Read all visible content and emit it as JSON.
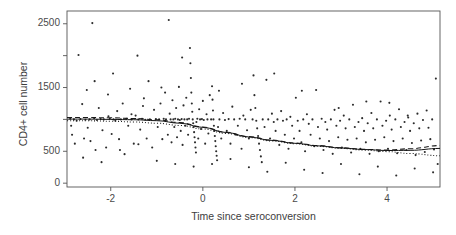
{
  "chart_data": {
    "type": "scatter",
    "title": "",
    "xlabel": "Time since seroconversion",
    "ylabel": "CD4+ cell number",
    "xlim": [
      -2.95,
      5.15
    ],
    "ylim": [
      -60,
      2700
    ],
    "grid": false,
    "legend": "none",
    "xticks": [
      -2,
      0,
      2,
      4
    ],
    "xticklabels": [
      "-2",
      "0",
      "2",
      "4"
    ],
    "yticks": [
      0,
      500,
      1000,
      1500,
      2000,
      2500
    ],
    "yticklabels": [
      "0",
      "500",
      "",
      "1500",
      "",
      "2500"
    ],
    "ytick_minor_unlabeled": [
      1000,
      2000
    ],
    "marker": "small-dot",
    "marker_color": "#2b2b2b",
    "marker_size_px": 1.4,
    "points": [
      [
        -2.88,
        1010
      ],
      [
        -2.86,
        900
      ],
      [
        -2.84,
        760
      ],
      [
        -2.8,
        1000
      ],
      [
        -2.78,
        620
      ],
      [
        -2.74,
        980
      ],
      [
        -2.7,
        2010
      ],
      [
        -2.66,
        1005
      ],
      [
        -2.62,
        1240
      ],
      [
        -2.58,
        700
      ],
      [
        -2.55,
        995
      ],
      [
        -2.52,
        1460
      ],
      [
        -2.5,
        870
      ],
      [
        -2.46,
        1000
      ],
      [
        -2.44,
        660
      ],
      [
        -2.4,
        2510
      ],
      [
        -2.36,
        1020
      ],
      [
        -2.33,
        520
      ],
      [
        -2.3,
        990
      ],
      [
        -2.26,
        1180
      ],
      [
        -2.22,
        1005
      ],
      [
        -2.18,
        830
      ],
      [
        -2.15,
        1000
      ],
      [
        -2.1,
        560
      ],
      [
        -2.06,
        1390
      ],
      [
        -2.02,
        1010
      ],
      [
        -1.98,
        770
      ],
      [
        -1.94,
        1000
      ],
      [
        -1.9,
        980
      ],
      [
        -1.86,
        1130
      ],
      [
        -1.82,
        690
      ],
      [
        -1.78,
        1000
      ],
      [
        -1.74,
        1250
      ],
      [
        -1.7,
        455
      ],
      [
        -1.66,
        1010
      ],
      [
        -1.62,
        900
      ],
      [
        -1.58,
        1480
      ],
      [
        -1.55,
        1000
      ],
      [
        -1.5,
        620
      ],
      [
        -1.46,
        1060
      ],
      [
        -1.42,
        2000
      ],
      [
        -1.4,
        1000
      ],
      [
        -1.36,
        840
      ],
      [
        -1.32,
        1010
      ],
      [
        -1.28,
        1330
      ],
      [
        -1.25,
        995
      ],
      [
        -1.22,
        700
      ],
      [
        -1.18,
        1600
      ],
      [
        -1.15,
        1000
      ],
      [
        -1.1,
        560
      ],
      [
        -1.06,
        1150
      ],
      [
        -1.02,
        1005
      ],
      [
        -0.98,
        880
      ],
      [
        -0.95,
        1000
      ],
      [
        -0.92,
        1250
      ],
      [
        -0.88,
        690
      ],
      [
        -0.85,
        1010
      ],
      [
        -0.82,
        1420
      ],
      [
        -0.8,
        1000
      ],
      [
        -0.76,
        760
      ],
      [
        -0.74,
        2560
      ],
      [
        -0.72,
        1090
      ],
      [
        -0.7,
        1000
      ],
      [
        -0.68,
        640
      ],
      [
        -0.66,
        1300
      ],
      [
        -0.64,
        1000
      ],
      [
        -0.62,
        880
      ],
      [
        -0.6,
        1010
      ],
      [
        -0.58,
        1180
      ],
      [
        -0.56,
        720
      ],
      [
        -0.54,
        1000
      ],
      [
        -0.52,
        1510
      ],
      [
        -0.5,
        990
      ],
      [
        -0.48,
        820
      ],
      [
        -0.46,
        1005
      ],
      [
        -0.44,
        600
      ],
      [
        -0.42,
        1220
      ],
      [
        -0.4,
        1000
      ],
      [
        -0.38,
        900
      ],
      [
        -0.36,
        1340
      ],
      [
        -0.34,
        1000
      ],
      [
        -0.32,
        760
      ],
      [
        -0.3,
        1010
      ],
      [
        -0.28,
        2120
      ],
      [
        -0.27,
        1880
      ],
      [
        -0.26,
        1650
      ],
      [
        -0.25,
        1420
      ],
      [
        -0.24,
        1250
      ],
      [
        -0.23,
        1120
      ],
      [
        -0.22,
        1000
      ],
      [
        -0.21,
        940
      ],
      [
        -0.2,
        880
      ],
      [
        -0.19,
        800
      ],
      [
        -0.18,
        720
      ],
      [
        -0.17,
        640
      ],
      [
        -0.16,
        560
      ],
      [
        -0.15,
        480
      ],
      [
        -0.14,
        960
      ],
      [
        -0.12,
        1010
      ],
      [
        -0.1,
        700
      ],
      [
        -0.08,
        1160
      ],
      [
        -0.06,
        1000
      ],
      [
        -0.04,
        850
      ],
      [
        -0.02,
        1005
      ],
      [
        0.0,
        1290
      ],
      [
        0.02,
        990
      ],
      [
        0.05,
        620
      ],
      [
        0.08,
        1080
      ],
      [
        0.1,
        1000
      ],
      [
        0.12,
        780
      ],
      [
        0.15,
        1380
      ],
      [
        0.18,
        1000
      ],
      [
        0.2,
        1520
      ],
      [
        0.21,
        1310
      ],
      [
        0.22,
        1140
      ],
      [
        0.23,
        1000
      ],
      [
        0.24,
        900
      ],
      [
        0.25,
        820
      ],
      [
        0.26,
        740
      ],
      [
        0.27,
        660
      ],
      [
        0.28,
        580
      ],
      [
        0.29,
        500
      ],
      [
        0.3,
        430
      ],
      [
        0.31,
        360
      ],
      [
        0.33,
        880
      ],
      [
        0.36,
        1000
      ],
      [
        0.4,
        700
      ],
      [
        0.44,
        1100
      ],
      [
        0.48,
        990
      ],
      [
        0.52,
        820
      ],
      [
        0.56,
        1005
      ],
      [
        0.6,
        620
      ],
      [
        0.64,
        1200
      ],
      [
        0.68,
        1000
      ],
      [
        0.72,
        760
      ],
      [
        0.76,
        900
      ],
      [
        0.8,
        1010
      ],
      [
        0.84,
        540
      ],
      [
        0.88,
        1060
      ],
      [
        0.92,
        1000
      ],
      [
        0.96,
        830
      ],
      [
        1.0,
        700
      ],
      [
        1.04,
        1150
      ],
      [
        1.08,
        1000
      ],
      [
        1.1,
        1690
      ],
      [
        1.12,
        1380
      ],
      [
        1.14,
        1180
      ],
      [
        1.16,
        980
      ],
      [
        1.18,
        860
      ],
      [
        1.2,
        740
      ],
      [
        1.22,
        620
      ],
      [
        1.24,
        520
      ],
      [
        1.26,
        420
      ],
      [
        1.28,
        330
      ],
      [
        1.3,
        1000
      ],
      [
        1.34,
        880
      ],
      [
        1.38,
        1620
      ],
      [
        1.42,
        1000
      ],
      [
        1.46,
        700
      ],
      [
        1.5,
        1090
      ],
      [
        1.54,
        960
      ],
      [
        1.58,
        820
      ],
      [
        1.62,
        1000
      ],
      [
        1.66,
        600
      ],
      [
        1.7,
        1130
      ],
      [
        1.74,
        980
      ],
      [
        1.78,
        760
      ],
      [
        1.82,
        1000
      ],
      [
        1.86,
        540
      ],
      [
        1.9,
        1040
      ],
      [
        1.94,
        900
      ],
      [
        1.98,
        700
      ],
      [
        2.02,
        1340
      ],
      [
        2.06,
        980
      ],
      [
        2.1,
        820
      ],
      [
        2.14,
        640
      ],
      [
        2.18,
        1000
      ],
      [
        2.22,
        500
      ],
      [
        2.26,
        1080
      ],
      [
        2.3,
        930
      ],
      [
        2.34,
        760
      ],
      [
        2.38,
        1000
      ],
      [
        2.42,
        580
      ],
      [
        2.46,
        1460
      ],
      [
        2.5,
        880
      ],
      [
        2.54,
        700
      ],
      [
        2.58,
        1010
      ],
      [
        2.62,
        520
      ],
      [
        2.66,
        960
      ],
      [
        2.7,
        840
      ],
      [
        2.74,
        660
      ],
      [
        2.78,
        1000
      ],
      [
        2.82,
        460
      ],
      [
        2.86,
        1150
      ],
      [
        2.9,
        900
      ],
      [
        2.94,
        720
      ],
      [
        2.98,
        980
      ],
      [
        3.02,
        560
      ],
      [
        3.06,
        1060
      ],
      [
        3.1,
        860
      ],
      [
        3.14,
        680
      ],
      [
        3.18,
        1000
      ],
      [
        3.22,
        480
      ],
      [
        3.26,
        1230
      ],
      [
        3.3,
        880
      ],
      [
        3.34,
        700
      ],
      [
        3.38,
        960
      ],
      [
        3.42,
        540
      ],
      [
        3.46,
        1020
      ],
      [
        3.5,
        820
      ],
      [
        3.54,
        640
      ],
      [
        3.58,
        940
      ],
      [
        3.62,
        460
      ],
      [
        3.66,
        1100
      ],
      [
        3.7,
        860
      ],
      [
        3.74,
        680
      ],
      [
        3.78,
        1000
      ],
      [
        3.82,
        500
      ],
      [
        3.86,
        1280
      ],
      [
        3.9,
        900
      ],
      [
        3.94,
        720
      ],
      [
        3.98,
        980
      ],
      [
        4.02,
        540
      ],
      [
        4.06,
        1060
      ],
      [
        4.1,
        840
      ],
      [
        4.14,
        660
      ],
      [
        4.18,
        1000
      ],
      [
        4.22,
        470
      ],
      [
        4.26,
        1160
      ],
      [
        4.3,
        880
      ],
      [
        4.34,
        700
      ],
      [
        4.38,
        960
      ],
      [
        4.42,
        520
      ],
      [
        4.46,
        1030
      ],
      [
        4.5,
        820
      ],
      [
        4.54,
        630
      ],
      [
        4.58,
        940
      ],
      [
        4.62,
        440
      ],
      [
        4.66,
        1090
      ],
      [
        4.7,
        860
      ],
      [
        4.74,
        670
      ],
      [
        4.78,
        990
      ],
      [
        4.82,
        490
      ],
      [
        4.86,
        1140
      ],
      [
        4.9,
        870
      ],
      [
        4.94,
        690
      ],
      [
        4.98,
        1000
      ],
      [
        5.02,
        530
      ],
      [
        5.06,
        1640
      ],
      [
        5.1,
        300
      ],
      [
        -2.6,
        400
      ],
      [
        -2.2,
        330
      ],
      [
        -1.8,
        520
      ],
      [
        -1.4,
        610
      ],
      [
        -1.0,
        350
      ],
      [
        -0.6,
        300
      ],
      [
        -0.2,
        260
      ],
      [
        0.2,
        300
      ],
      [
        0.6,
        380
      ],
      [
        1.0,
        250
      ],
      [
        1.4,
        180
      ],
      [
        1.8,
        320
      ],
      [
        2.2,
        210
      ],
      [
        2.6,
        160
      ],
      [
        3.0,
        300
      ],
      [
        3.4,
        140
      ],
      [
        3.8,
        260
      ],
      [
        4.2,
        120
      ],
      [
        4.6,
        230
      ],
      [
        5.0,
        170
      ],
      [
        -2.35,
        1600
      ],
      [
        -1.95,
        1720
      ],
      [
        -1.3,
        1210
      ],
      [
        -0.9,
        1500
      ],
      [
        -0.45,
        1970
      ],
      [
        0.35,
        1450
      ],
      [
        0.85,
        1560
      ],
      [
        1.55,
        1720
      ],
      [
        2.15,
        1450
      ],
      [
        2.95,
        1180
      ],
      [
        3.55,
        1280
      ],
      [
        4.05,
        1260
      ],
      [
        4.45,
        1060
      ],
      [
        -2.05,
        1050
      ],
      [
        -1.55,
        1080
      ]
    ],
    "curves": [
      {
        "name": "dashed-fit",
        "style": "dashed",
        "color": "#1a1a1a",
        "x": [
          -2.95,
          -2.5,
          -2.0,
          -1.5,
          -1.0,
          -0.5,
          0.0,
          0.5,
          1.0,
          1.5,
          2.0,
          2.5,
          3.0,
          3.5,
          4.0,
          4.5,
          5.15
        ],
        "y": [
          1030,
          1030,
          1025,
          1015,
          995,
          950,
          880,
          800,
          730,
          675,
          630,
          590,
          555,
          530,
          520,
          540,
          590
        ]
      },
      {
        "name": "solid-fit",
        "style": "solid",
        "color": "#141414",
        "x": [
          -2.95,
          -2.5,
          -2.0,
          -1.5,
          -1.0,
          -0.5,
          0.0,
          0.5,
          1.0,
          1.5,
          2.0,
          2.5,
          3.0,
          3.5,
          4.0,
          4.5,
          5.15
        ],
        "y": [
          1005,
          1005,
          1000,
          995,
          980,
          940,
          875,
          795,
          725,
          670,
          625,
          585,
          552,
          528,
          512,
          515,
          545
        ]
      },
      {
        "name": "dotted-fit",
        "style": "dotted",
        "color": "#1a1a1a",
        "x": [
          -2.95,
          -2.5,
          -2.0,
          -1.5,
          -1.0,
          -0.5,
          0.0,
          0.5,
          1.0,
          1.5,
          2.0,
          2.5,
          3.0,
          3.5,
          4.0,
          4.5,
          5.15
        ],
        "y": [
          980,
          978,
          972,
          960,
          940,
          905,
          850,
          780,
          715,
          662,
          618,
          578,
          545,
          518,
          495,
          465,
          430
        ]
      }
    ]
  }
}
